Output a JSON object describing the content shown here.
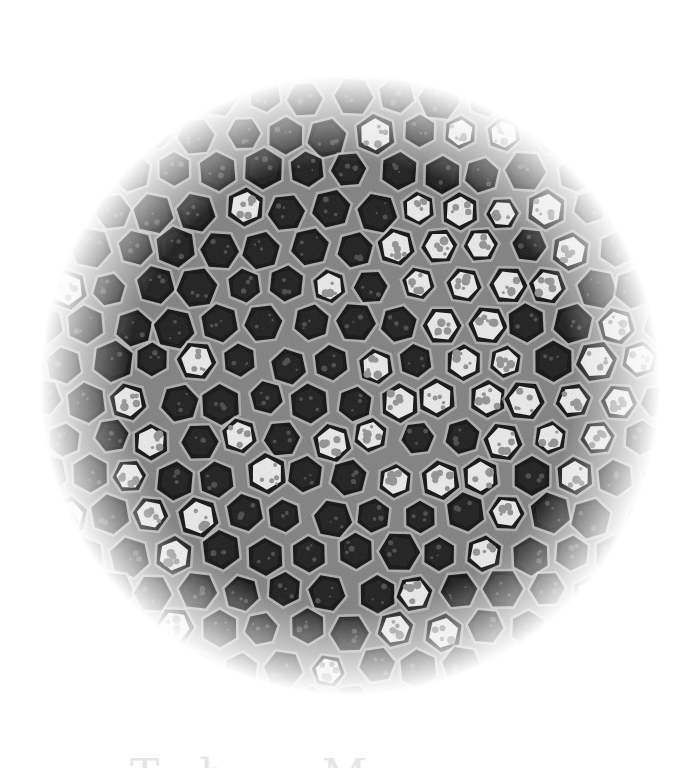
{
  "figure": {
    "style": "grayscale, circular vignette fading to white",
    "colors": {
      "background": "#ffffff",
      "card_border": "#c8c8c8",
      "matrix": "#8a8a8a",
      "particle_dark": "#2a2a2a",
      "particle_shell": "#1c1c1c",
      "particle_core_light": "#efefef",
      "membrane_light": "#d6d6d6"
    },
    "vignette": {
      "center_x": 350,
      "center_y": 385,
      "radius": 300
    },
    "particle_grid": {
      "spacing": 44,
      "radius": 19,
      "bright_region_center_x": 480,
      "bright_region_center_y": 360
    }
  },
  "caption": {
    "text": "Th  M  "
  }
}
